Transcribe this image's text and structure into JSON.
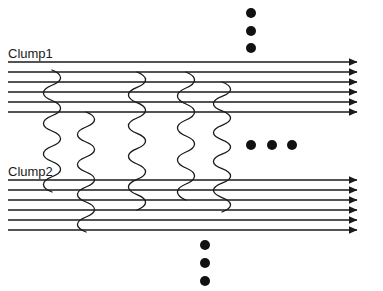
{
  "diagram": {
    "type": "schematic",
    "canvas": {
      "width": 383,
      "height": 291,
      "background": "#ffffff"
    },
    "stroke_color": "#1a1a1a",
    "dot_color": "#111111",
    "labels": [
      {
        "id": "clump1",
        "text": "Clump1",
        "x": 8,
        "y": 47
      },
      {
        "id": "clump2",
        "text": "Clump2",
        "x": 8,
        "y": 165
      }
    ],
    "clumps": [
      {
        "name": "Clump1",
        "line_count": 6,
        "x_start": 8,
        "x_end": 357,
        "line_ys": [
          62,
          72,
          82,
          92,
          102,
          112
        ],
        "arrowheads": true
      },
      {
        "name": "Clump2",
        "line_count": 6,
        "x_start": 8,
        "x_end": 357,
        "line_ys": [
          180,
          190,
          200,
          210,
          220,
          230
        ],
        "arrowheads": true
      }
    ],
    "connectors": [
      {
        "id": "wave-1",
        "x": 52,
        "y_top": 70,
        "y_bottom": 192,
        "amplitude": 6,
        "periods": 8
      },
      {
        "id": "wave-2",
        "x": 86,
        "y_top": 112,
        "y_bottom": 232,
        "amplitude": 6,
        "periods": 8
      },
      {
        "id": "wave-3",
        "x": 137,
        "y_top": 72,
        "y_bottom": 210,
        "amplitude": 6,
        "periods": 9
      },
      {
        "id": "wave-4",
        "x": 186,
        "y_top": 72,
        "y_bottom": 200,
        "amplitude": 6,
        "periods": 8
      },
      {
        "id": "wave-5",
        "x": 222,
        "y_top": 82,
        "y_bottom": 212,
        "amplitude": 6,
        "periods": 9
      }
    ],
    "dot_groups": [
      {
        "id": "dots-top",
        "orientation": "vertical",
        "radius": 5,
        "dots": [
          {
            "cx": 251,
            "cy": 13
          },
          {
            "cx": 251,
            "cy": 31
          },
          {
            "cx": 251,
            "cy": 48
          }
        ]
      },
      {
        "id": "dots-middle",
        "orientation": "horizontal",
        "radius": 5,
        "dots": [
          {
            "cx": 251,
            "cy": 145
          },
          {
            "cx": 272,
            "cy": 145
          },
          {
            "cx": 292,
            "cy": 145
          }
        ]
      },
      {
        "id": "dots-bottom",
        "orientation": "vertical",
        "radius": 5,
        "dots": [
          {
            "cx": 205,
            "cy": 245
          },
          {
            "cx": 205,
            "cy": 263
          },
          {
            "cx": 205,
            "cy": 281
          }
        ]
      }
    ]
  }
}
